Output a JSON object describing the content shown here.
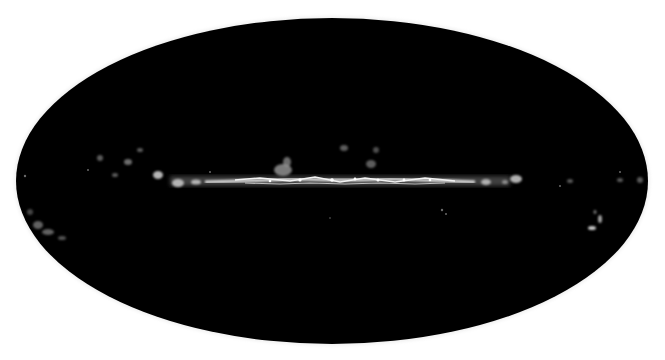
{
  "figure": {
    "projection": "mollweide",
    "background_color": "#ffffff",
    "map_fill_color": "#000000",
    "emission_color": "#e8e8e8",
    "ellipse": {
      "cx": 332,
      "cy": 181,
      "rx": 316,
      "ry": 163
    },
    "galactic_plane": {
      "y": 181,
      "bright_x_start": 200,
      "bright_x_end": 470
    }
  }
}
